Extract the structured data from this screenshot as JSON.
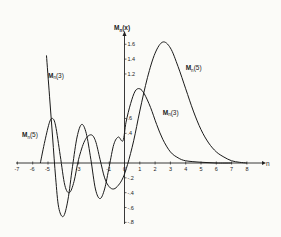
{
  "chart_data": {
    "type": "line",
    "title": "",
    "xlabel": "n",
    "ylabel": "M_n(x)",
    "xlim": [
      -7,
      8.5
    ],
    "ylim": [
      -0.8,
      1.8
    ],
    "x_ticks": [
      "-7",
      "-6",
      "-5",
      "-3",
      "-1",
      "0",
      "1",
      "2",
      "3",
      "4",
      "5",
      "6",
      "7",
      "8"
    ],
    "y_ticks": [
      "1.6",
      "1.4",
      "1.2",
      ".6",
      ".4",
      "-.2",
      "-.4",
      "-.6",
      "-.8"
    ],
    "grid": false,
    "series": [
      {
        "name": "M_n(3)",
        "label": "Mn(3)",
        "points": [
          [
            -5.1,
            1.45
          ],
          [
            -4.9,
            0.9
          ],
          [
            -4.7,
            0.35
          ],
          [
            -4.5,
            -0.2
          ],
          [
            -4.3,
            -0.6
          ],
          [
            -4.0,
            -0.72
          ],
          [
            -3.7,
            -0.5
          ],
          [
            -3.4,
            -0.05
          ],
          [
            -3.1,
            0.35
          ],
          [
            -2.8,
            0.52
          ],
          [
            -2.5,
            0.4
          ],
          [
            -2.2,
            0.05
          ],
          [
            -1.9,
            -0.35
          ],
          [
            -1.6,
            -0.48
          ],
          [
            -1.3,
            -0.35
          ],
          [
            -1.0,
            -0.05
          ],
          [
            -0.7,
            0.25
          ],
          [
            -0.4,
            0.35
          ],
          [
            -0.1,
            0.3
          ],
          [
            0.1,
            0.55
          ],
          [
            0.4,
            0.8
          ],
          [
            0.7,
            0.97
          ],
          [
            1.0,
            1.0
          ],
          [
            1.3,
            0.93
          ],
          [
            1.7,
            0.75
          ],
          [
            2.1,
            0.52
          ],
          [
            2.5,
            0.32
          ],
          [
            3.0,
            0.15
          ],
          [
            3.5,
            0.07
          ],
          [
            4.0,
            0.03
          ],
          [
            5.0,
            0.01
          ],
          [
            6.0,
            0.0
          ],
          [
            7.0,
            0.0
          ]
        ]
      },
      {
        "name": "M_n(5)",
        "label": "Mn(5)",
        "points": [
          [
            -5.5,
            0.0
          ],
          [
            -5.2,
            0.3
          ],
          [
            -4.9,
            0.55
          ],
          [
            -4.7,
            0.6
          ],
          [
            -4.5,
            0.5
          ],
          [
            -4.2,
            0.1
          ],
          [
            -3.9,
            -0.3
          ],
          [
            -3.6,
            -0.4
          ],
          [
            -3.3,
            -0.25
          ],
          [
            -3.0,
            0.05
          ],
          [
            -2.6,
            0.3
          ],
          [
            -2.2,
            0.38
          ],
          [
            -1.9,
            0.3
          ],
          [
            -1.6,
            0.05
          ],
          [
            -1.3,
            -0.2
          ],
          [
            -1.0,
            -0.32
          ],
          [
            -0.7,
            -0.35
          ],
          [
            -0.4,
            -0.3
          ],
          [
            -0.1,
            -0.2
          ],
          [
            0.2,
            -0.02
          ],
          [
            0.6,
            0.3
          ],
          [
            1.0,
            0.7
          ],
          [
            1.5,
            1.15
          ],
          [
            2.0,
            1.48
          ],
          [
            2.5,
            1.63
          ],
          [
            3.0,
            1.55
          ],
          [
            3.5,
            1.3
          ],
          [
            4.0,
            1.0
          ],
          [
            4.5,
            0.7
          ],
          [
            5.0,
            0.45
          ],
          [
            5.5,
            0.27
          ],
          [
            6.0,
            0.15
          ],
          [
            6.5,
            0.08
          ],
          [
            7.0,
            0.03
          ],
          [
            7.5,
            0.01
          ],
          [
            8.0,
            0.0
          ]
        ]
      }
    ],
    "annotations": [
      {
        "text": "Mn(3)",
        "near": [
          -5.0,
          1.15
        ]
      },
      {
        "text": "Mn(5)",
        "near": [
          -6.7,
          0.35
        ]
      },
      {
        "text": "Mn(5)",
        "near": [
          4.0,
          1.25
        ]
      },
      {
        "text": "Mn(3)",
        "near": [
          2.5,
          0.65
        ]
      }
    ],
    "legend": "none (inline labels)"
  },
  "labels": {
    "y_axis": "M",
    "y_axis_sub": "n",
    "y_axis_arg": "(x)",
    "x_axis": "n",
    "curve_label_main": "M",
    "curve_label_sub": "n"
  }
}
